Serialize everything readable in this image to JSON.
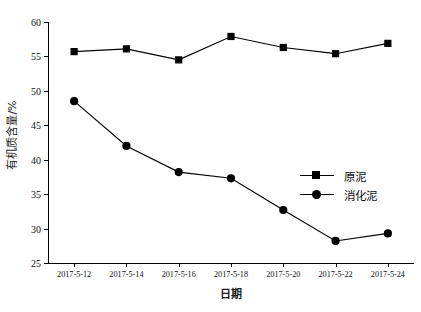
{
  "chart_data": {
    "type": "line",
    "title": "",
    "xlabel": "日期",
    "ylabel": "有机质含量/%",
    "categories": [
      "2017-5-12",
      "2017-5-14",
      "2017-5-16",
      "2017-5-18",
      "2017-5-20",
      "2017-5-22",
      "2017-5-24"
    ],
    "ylim": [
      25,
      60
    ],
    "yticks": [
      25,
      30,
      35,
      40,
      45,
      50,
      55,
      60
    ],
    "ytick_labels": [
      "25",
      "30",
      "35",
      "40",
      "45",
      "50",
      "55",
      "60"
    ],
    "grid": false,
    "legend_position": "center-right",
    "series": [
      {
        "name": "原泥",
        "marker": "square",
        "color": "#000000",
        "values": [
          55.7,
          56.1,
          54.5,
          57.9,
          56.3,
          55.4,
          56.9
        ]
      },
      {
        "name": "消化泥",
        "marker": "circle",
        "color": "#000000",
        "values": [
          48.5,
          42.0,
          38.2,
          37.3,
          32.7,
          28.2,
          29.3
        ]
      }
    ]
  },
  "legend": {
    "items": [
      {
        "label": "原泥",
        "marker": "square"
      },
      {
        "label": "消化泥",
        "marker": "circle"
      }
    ]
  }
}
